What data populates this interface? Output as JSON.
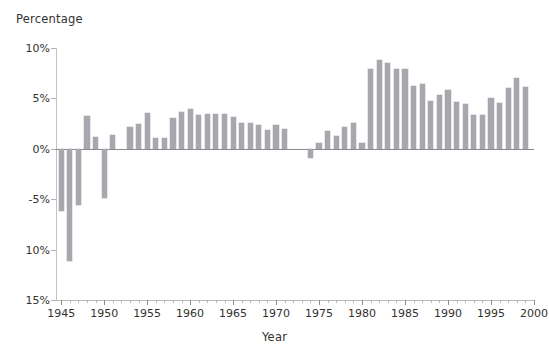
{
  "chart_data": {
    "type": "bar",
    "title": "",
    "ylabel": "Percentage",
    "xlabel": "Year",
    "grid": false,
    "legend": "none",
    "ylim": [
      -15,
      10
    ],
    "xlim": [
      1944.4,
      2000
    ],
    "y_tick_values": [
      10,
      5,
      0,
      -5,
      -10,
      -15
    ],
    "y_tick_labels": [
      "10%",
      "5%",
      "0%",
      "-5%",
      "10%",
      "15%"
    ],
    "x_tick_values": [
      1945,
      1950,
      1955,
      1960,
      1965,
      1970,
      1975,
      1980,
      1985,
      1990,
      1995,
      2000
    ],
    "x_tick_labels": [
      "1945",
      "1950",
      "1955",
      "1960",
      "1965",
      "1970",
      "1975",
      "1980",
      "1985",
      "1990",
      "1995",
      "2000"
    ],
    "bar_color": "#a9a6ae",
    "categories": [
      1945,
      1946,
      1947,
      1948,
      1949,
      1950,
      1951,
      1952,
      1953,
      1954,
      1955,
      1956,
      1957,
      1958,
      1959,
      1960,
      1961,
      1962,
      1963,
      1964,
      1965,
      1966,
      1967,
      1968,
      1969,
      1970,
      1971,
      1972,
      1973,
      1974,
      1975,
      1976,
      1977,
      1978,
      1979,
      1980,
      1981,
      1982,
      1983,
      1984,
      1985,
      1986,
      1987,
      1988,
      1989,
      1990,
      1991,
      1992,
      1993,
      1994,
      1995,
      1996,
      1997,
      1998,
      1999
    ],
    "values": [
      -6.2,
      -11.1,
      -5.6,
      3.3,
      1.2,
      -4.9,
      1.4,
      0.0,
      2.2,
      2.5,
      3.6,
      1.1,
      1.1,
      3.1,
      3.7,
      3.9,
      3.4,
      3.5,
      3.5,
      3.5,
      3.2,
      2.6,
      2.6,
      2.4,
      1.9,
      2.4,
      2.0,
      0.0,
      0.0,
      -0.9,
      0.6,
      1.8,
      1.3,
      2.2,
      2.6,
      0.6,
      7.9,
      8.8,
      8.5,
      7.9,
      7.9,
      6.2,
      6.4,
      4.7,
      5.3,
      5.8,
      4.6,
      4.4,
      3.4,
      3.4,
      5.0,
      4.5,
      6.0,
      7.0,
      6.1
    ],
    "axis_note": "Bottom two y-axis labels are printed without a minus sign in the source scan"
  },
  "axes": {
    "y_title": "Percentage",
    "x_title": "Year"
  }
}
